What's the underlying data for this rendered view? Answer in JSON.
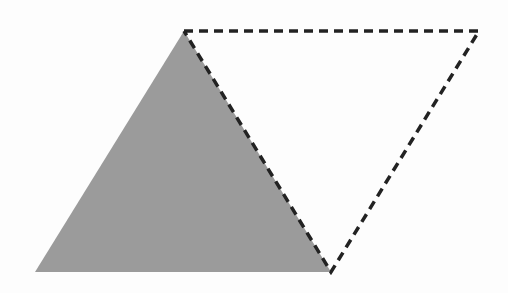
{
  "diagram": {
    "width": 508,
    "height": 293,
    "background_color": "#fdfdfd",
    "shaded_triangle": {
      "points": "184,31 331,272 35,272",
      "fill": "#9b9b9b"
    },
    "dashed_outline": {
      "points": "184,31 479,31 331,272",
      "stroke": "#222222",
      "stroke_width": 3.5,
      "dash": "9,6"
    },
    "dashed_shared_edge": {
      "x1": 184,
      "y1": 31,
      "x2": 331,
      "y2": 272
    },
    "vertices": [
      {
        "name": "top-left",
        "x": 184,
        "y": 31
      },
      {
        "name": "top-right",
        "x": 479,
        "y": 31
      },
      {
        "name": "bottom-right",
        "x": 331,
        "y": 272
      },
      {
        "name": "bottom-left",
        "x": 35,
        "y": 272
      }
    ]
  }
}
